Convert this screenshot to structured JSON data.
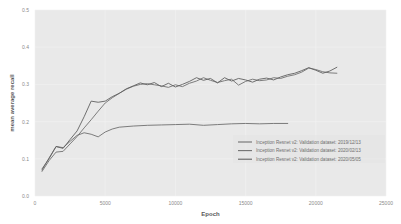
{
  "chart_data": {
    "type": "line",
    "title": "",
    "xlabel": "Epoch",
    "ylabel": "mean average recall",
    "xlim": [
      0,
      25000
    ],
    "ylim": [
      0.0,
      0.5
    ],
    "xticks": [
      0,
      5000,
      10000,
      15000,
      20000,
      25000
    ],
    "xtick_labels": [
      "0",
      "5000",
      "10000",
      "15000",
      "20000",
      "25000"
    ],
    "yticks": [
      0.0,
      0.1,
      0.2,
      0.3,
      0.4,
      0.5
    ],
    "ytick_labels": [
      "0.0",
      "0.1",
      "0.2",
      "0.3",
      "0.4",
      "0.5"
    ],
    "grid": true,
    "legend_position": "lower right",
    "background": "#e9e9e9",
    "series": [
      {
        "name": "Inception Resnet v2: Validation dataset: 2019/12/13",
        "color": "#6f6f6f",
        "x": [
          500,
          1000,
          1500,
          2000,
          2500,
          3000,
          3500,
          4000,
          4500,
          5000,
          5500,
          6000,
          7000,
          8000,
          9000,
          10000,
          11000,
          12000,
          13000,
          14000,
          15000,
          16000,
          17000,
          18000
        ],
        "y": [
          0.073,
          0.1,
          0.133,
          0.13,
          0.147,
          0.163,
          0.17,
          0.166,
          0.159,
          0.172,
          0.18,
          0.185,
          0.188,
          0.19,
          0.191,
          0.192,
          0.193,
          0.19,
          0.192,
          0.194,
          0.195,
          0.194,
          0.195,
          0.195
        ]
      },
      {
        "name": "Inception Resnet v2: Validation dataset: 2020/02/13",
        "color": "#707070",
        "x": [
          500,
          1000,
          1500,
          2000,
          2500,
          3000,
          3500,
          4000,
          4500,
          5000,
          5500,
          6000,
          6500,
          7000,
          7500,
          8000,
          8500,
          9000,
          9500,
          10000,
          10500,
          11000,
          11500,
          12000,
          12500,
          13000,
          13500,
          14000,
          14500,
          15000,
          15500,
          16000,
          16500,
          17000,
          17500,
          18000,
          18500,
          19000,
          19500,
          20000,
          20500,
          21000,
          21500
        ],
        "y": [
          0.066,
          0.095,
          0.118,
          0.12,
          0.14,
          0.16,
          0.183,
          0.205,
          0.228,
          0.25,
          0.264,
          0.276,
          0.287,
          0.295,
          0.3,
          0.302,
          0.299,
          0.296,
          0.292,
          0.299,
          0.294,
          0.303,
          0.309,
          0.318,
          0.311,
          0.305,
          0.31,
          0.314,
          0.298,
          0.308,
          0.314,
          0.31,
          0.312,
          0.318,
          0.316,
          0.322,
          0.326,
          0.333,
          0.344,
          0.34,
          0.334,
          0.331,
          0.33
        ]
      },
      {
        "name": "Inception Resnet v2: Validation dataset: 2020/05/05",
        "color": "#616161",
        "x": [
          500,
          1000,
          1500,
          2000,
          2500,
          3000,
          3500,
          4000,
          4500,
          5000,
          5500,
          6000,
          6500,
          7000,
          7500,
          8000,
          8500,
          9000,
          9500,
          10000,
          10500,
          11000,
          11500,
          12000,
          12500,
          13000,
          13500,
          14000,
          14500,
          15000,
          15500,
          16000,
          16500,
          17000,
          17500,
          18000,
          18500,
          19000,
          19500,
          20000,
          20500,
          21000,
          21500
        ],
        "y": [
          0.07,
          0.102,
          0.133,
          0.128,
          0.152,
          0.175,
          0.213,
          0.255,
          0.252,
          0.255,
          0.267,
          0.276,
          0.288,
          0.296,
          0.304,
          0.299,
          0.305,
          0.294,
          0.303,
          0.293,
          0.3,
          0.308,
          0.318,
          0.311,
          0.316,
          0.304,
          0.318,
          0.309,
          0.316,
          0.312,
          0.306,
          0.314,
          0.317,
          0.312,
          0.32,
          0.326,
          0.33,
          0.337,
          0.345,
          0.338,
          0.33,
          0.336,
          0.346
        ]
      }
    ]
  }
}
